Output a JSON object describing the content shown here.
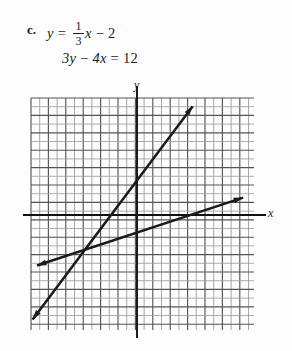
{
  "problem": {
    "label": "c.",
    "equation1": {
      "lhs": "y",
      "eq": "=",
      "fraction_numerator": "1",
      "fraction_denominator": "3",
      "variable": "x",
      "operator": "−",
      "constant": "2",
      "text": "y = (1/3)x − 2"
    },
    "equation2": {
      "text": "3y − 4x = 12",
      "term1": "3y",
      "operator": "−",
      "term2": "4x",
      "eq": "=",
      "rhs": "12"
    }
  },
  "chart_data": {
    "type": "line",
    "title": "",
    "xlabel": "x",
    "ylabel": "y",
    "grid": true,
    "grid_spacing_units": 1,
    "xlim": [
      -12,
      14
    ],
    "ylim": [
      -13,
      14
    ],
    "origin_px": [
      137,
      215
    ],
    "unit_px": 8.7,
    "legend": "none",
    "series": [
      {
        "name": "3y − 4x = 12",
        "equation": "y = (4/3)x + 4",
        "slope": 1.3333,
        "intercept": 4,
        "style": "solid-arrow-both",
        "color": "#1a1a1a",
        "points": [
          {
            "x": -12,
            "y": -12
          },
          {
            "x": 6.4,
            "y": 12.5
          }
        ],
        "x_intercept": -3,
        "y_intercept": 4
      },
      {
        "name": "y = (1/3)x − 2",
        "equation": "y = (1/3)x − 2",
        "slope": 0.3333,
        "intercept": -2,
        "style": "solid-arrow-both",
        "color": "#1a1a1a",
        "points": [
          {
            "x": -11.5,
            "y": -5.8
          },
          {
            "x": 12.2,
            "y": 2.0
          }
        ],
        "x_intercept": 6,
        "y_intercept": -2
      }
    ],
    "intersection": {
      "x": -7.2,
      "y": -5.4
    },
    "grid_extent_px": {
      "left": 31,
      "top": 98,
      "right": 254,
      "bottom": 330
    },
    "axis_colors": {
      "grid": "#555555",
      "grid_light": "#9a9a9a",
      "axis": "#111111"
    }
  }
}
